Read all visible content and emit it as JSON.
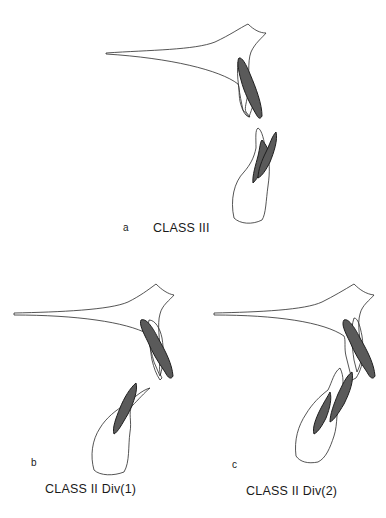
{
  "figure": {
    "panels": [
      {
        "letter": "a",
        "title": "CLASS III"
      },
      {
        "letter": "b",
        "title": "CLASS II Div(1)"
      },
      {
        "letter": "c",
        "title": "CLASS II Div(2)"
      }
    ],
    "colors": {
      "outline": "#2a2a2a",
      "shaded": "#5a5a5a",
      "background": "#ffffff"
    }
  }
}
